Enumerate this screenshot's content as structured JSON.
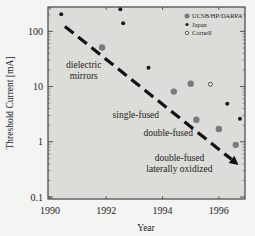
{
  "chart_data": {
    "type": "scatter",
    "title": "",
    "xlabel": "Year",
    "ylabel": "Threshold Current [mA]",
    "xlim": [
      1990,
      1997
    ],
    "ylim": [
      0.1,
      300
    ],
    "yscale": "log",
    "x_ticks": [
      1990,
      1992,
      1994,
      1996
    ],
    "x_tick_labels": [
      "1990",
      "1992",
      "1994",
      "1996"
    ],
    "y_ticks": [
      0.1,
      1,
      10,
      100
    ],
    "y_tick_labels": [
      "0.1",
      "1",
      "10",
      "100"
    ],
    "grid": false,
    "legend_position": "top-right",
    "series": [
      {
        "name": "UCSB/HP/DARPA",
        "marker": "large-gray-dot",
        "color": "#7a7a7a",
        "points": [
          {
            "x": 1991.85,
            "y": 51
          },
          {
            "x": 1994.4,
            "y": 8.1
          },
          {
            "x": 1995.0,
            "y": 11.3
          },
          {
            "x": 1995.2,
            "y": 2.5
          },
          {
            "x": 1996.0,
            "y": 1.7
          },
          {
            "x": 1996.6,
            "y": 0.88
          }
        ]
      },
      {
        "name": "Japan",
        "marker": "small-black-dot",
        "color": "#1a1a1a",
        "points": [
          {
            "x": 1990.4,
            "y": 204
          },
          {
            "x": 1992.5,
            "y": 250
          },
          {
            "x": 1992.6,
            "y": 140
          },
          {
            "x": 1993.5,
            "y": 22
          },
          {
            "x": 1996.3,
            "y": 4.9
          },
          {
            "x": 1996.75,
            "y": 2.6
          }
        ]
      },
      {
        "name": "Cornell",
        "marker": "open-circle",
        "color": "#333333",
        "points": [
          {
            "x": 1995.7,
            "y": 11
          }
        ]
      }
    ],
    "trend_arrow": {
      "style": "dashed",
      "from": {
        "x": 1990.53,
        "y": 123
      },
      "to": {
        "x": 1996.7,
        "y": 0.38
      }
    },
    "annotations": [
      {
        "lines": [
          "dielectric",
          "mirrors"
        ],
        "x": 1991.2,
        "y": 22
      },
      {
        "lines": [
          "single-fused"
        ],
        "x": 1993.05,
        "y": 2.7
      },
      {
        "lines": [
          "double-fused"
        ],
        "x": 1994.2,
        "y": 1.25
      },
      {
        "lines": [
          "double-fused",
          "laterally oxidized"
        ],
        "x": 1994.6,
        "y": 0.45
      }
    ]
  }
}
